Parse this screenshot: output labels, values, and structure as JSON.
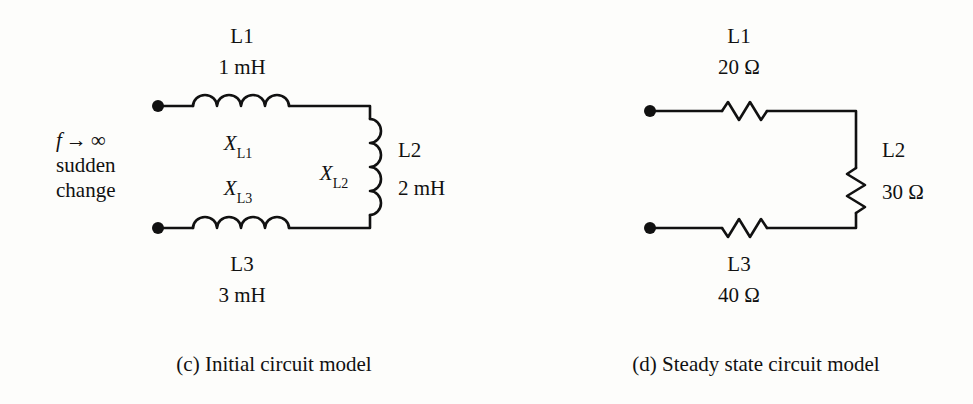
{
  "figure": {
    "type": "circuit-diagram-pair",
    "background_color": "#fdfdfb",
    "ink_color": "#111111"
  },
  "panel_c": {
    "caption": "(c) Initial circuit model",
    "condition": {
      "line1_f": "f",
      "line1_arrow": "→",
      "line1_limit": "∞",
      "line2": "sudden",
      "line3": "change"
    },
    "components": [
      {
        "id": "L1",
        "name": "L1",
        "value": "1 mH",
        "reactance_symbol": "X",
        "reactance_subscript": "L1",
        "symbol": "inductor",
        "orientation": "horizontal",
        "position": "top"
      },
      {
        "id": "L2",
        "name": "L2",
        "value": "2 mH",
        "reactance_symbol": "X",
        "reactance_subscript": "L2",
        "symbol": "inductor",
        "orientation": "vertical",
        "position": "right"
      },
      {
        "id": "L3",
        "name": "L3",
        "value": "3 mH",
        "reactance_symbol": "X",
        "reactance_subscript": "L3",
        "symbol": "inductor",
        "orientation": "horizontal",
        "position": "bottom"
      }
    ],
    "terminals": [
      {
        "id": "top-terminal",
        "label": ""
      },
      {
        "id": "bottom-terminal",
        "label": ""
      }
    ]
  },
  "panel_d": {
    "caption": "(d) Steady state circuit model",
    "components": [
      {
        "id": "L1",
        "name": "L1",
        "value": "20 Ω",
        "symbol": "resistor",
        "orientation": "horizontal",
        "position": "top"
      },
      {
        "id": "L2",
        "name": "L2",
        "value": "30 Ω",
        "symbol": "resistor",
        "orientation": "vertical",
        "position": "right"
      },
      {
        "id": "L3",
        "name": "L3",
        "value": "40 Ω",
        "symbol": "resistor",
        "orientation": "horizontal",
        "position": "bottom"
      }
    ],
    "terminals": [
      {
        "id": "top-terminal",
        "label": ""
      },
      {
        "id": "bottom-terminal",
        "label": ""
      }
    ]
  }
}
